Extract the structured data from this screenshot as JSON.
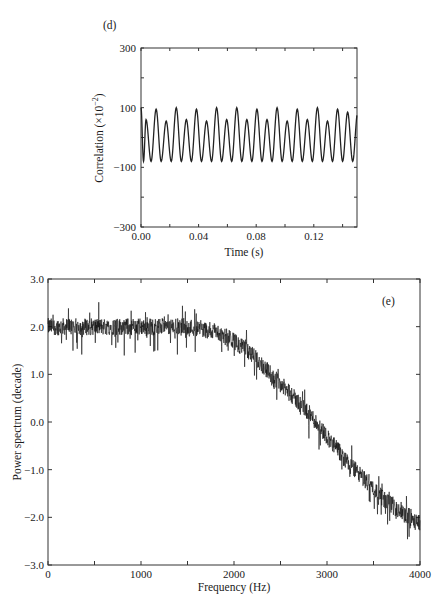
{
  "chart_data": [
    {
      "panel": "(d)",
      "type": "line",
      "title": "",
      "xlabel": "Time (s)",
      "ylabel": "Correlation (×10⁻²)",
      "xlim": [
        0,
        0.15
      ],
      "ylim": [
        -300,
        300
      ],
      "xticks": [
        "0.00",
        "0.04",
        "0.08",
        "0.12"
      ],
      "yticks": [
        "300",
        "100",
        "−100",
        "−300"
      ],
      "grid": false,
      "legend": null,
      "description": "Periodic correlation oscillating at ~140 Hz; peaks alternate between ~100 and ~60, troughs near −80",
      "series": [
        {
          "name": "correlation",
          "peak_times": [
            0.0,
            0.0035,
            0.0105,
            0.0175,
            0.0245,
            0.0315,
            0.0385,
            0.0455,
            0.0525,
            0.0595,
            0.0665,
            0.0735,
            0.0805,
            0.0875,
            0.0945,
            0.1015,
            0.1085,
            0.1155,
            0.1225,
            0.1295,
            0.1365,
            0.1435
          ],
          "peak_values": [
            100,
            60,
            95,
            55,
            100,
            60,
            95,
            55,
            100,
            60,
            100,
            60,
            95,
            60,
            100,
            55,
            95,
            60,
            100,
            55,
            95,
            85
          ],
          "trough_value": -80
        }
      ]
    },
    {
      "panel": "(e)",
      "type": "line",
      "title": "",
      "xlabel": "Frequency (Hz)",
      "ylabel": "Power spectrum (decade)",
      "xlim": [
        0,
        4000
      ],
      "ylim": [
        -3.0,
        3.0
      ],
      "xticks": [
        "0",
        "1000",
        "2000",
        "3000",
        "4000"
      ],
      "yticks": [
        "3.0",
        "2.0",
        "1.0",
        "0.0",
        "−1.0",
        "−2.0",
        "−3.0"
      ],
      "grid": false,
      "legend": null,
      "description": "Noisy power spectrum flat near 2.0 decades up to ~1600 Hz, rolling off to ~−2.0 at 4000 Hz",
      "series": [
        {
          "name": "power spectrum (mean envelope)",
          "x": [
            0,
            500,
            1000,
            1500,
            1800,
            2000,
            2200,
            2400,
            2600,
            2800,
            3000,
            3200,
            3400,
            3600,
            3800,
            4000
          ],
          "y": [
            2.0,
            2.0,
            2.0,
            2.0,
            1.9,
            1.7,
            1.4,
            1.0,
            0.6,
            0.2,
            -0.3,
            -0.8,
            -1.2,
            -1.6,
            -1.9,
            -2.1
          ],
          "noise_band": 0.3
        }
      ]
    }
  ],
  "panels": {
    "d": {
      "label": "(d)",
      "xlabel": "Time (s)",
      "ylabel": "Correlation (×10",
      "ylabel_exp": "−2",
      "ylabel_tail": ")",
      "xticks": [
        "0.00",
        "0.04",
        "0.08",
        "0.12"
      ],
      "yticks": [
        "300",
        "100",
        "−100",
        "−300"
      ]
    },
    "e": {
      "label": "(e)",
      "xlabel": "Frequency (Hz)",
      "ylabel": "Power spectrum (decade)",
      "xticks": [
        "0",
        "1000",
        "2000",
        "3000",
        "4000"
      ],
      "yticks": [
        "3.0",
        "2.0",
        "1.0",
        "0.0",
        "−1.0",
        "−2.0",
        "−3.0"
      ]
    }
  }
}
